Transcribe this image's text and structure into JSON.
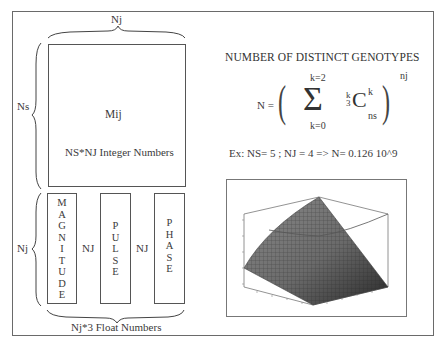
{
  "matrix": {
    "top_brace_label": "Nj",
    "left_brace_label": "Ns",
    "name": "Mij",
    "description": "NS*NJ Integer Numbers"
  },
  "vectors": {
    "left_brace_label": "Nj",
    "columns": [
      {
        "name": "MAGNITUDE",
        "letters": [
          "M",
          "A",
          "G",
          "N",
          "I",
          "T",
          "U",
          "D",
          "E"
        ]
      },
      {
        "name": "PULSE",
        "letters": [
          "P",
          "U",
          "L",
          "S",
          "E"
        ]
      },
      {
        "name": "PHASE",
        "letters": [
          "P",
          "H",
          "A",
          "S",
          "E"
        ]
      }
    ],
    "gap_labels": [
      "NJ",
      "NJ"
    ],
    "bottom_brace_label": "Nj*3 Float Numbers"
  },
  "formula": {
    "title": "NUMBER OF DISTINCT GENOTYPES",
    "lhs": "N =",
    "sum_upper": "k=2",
    "sum_lower": "k=0",
    "sigma": "Σ",
    "pre_superscript": "k",
    "pre_subscript": "3",
    "C": "C",
    "C_superscript": "k",
    "C_subscript": "ns",
    "exponent": "nj",
    "example": "Ex: NS= 5 ; NJ = 4  => N= 0.126 10^9"
  },
  "plot": {
    "type": "3d-surface",
    "description": "Surface plot of N as function of NS and NJ"
  }
}
